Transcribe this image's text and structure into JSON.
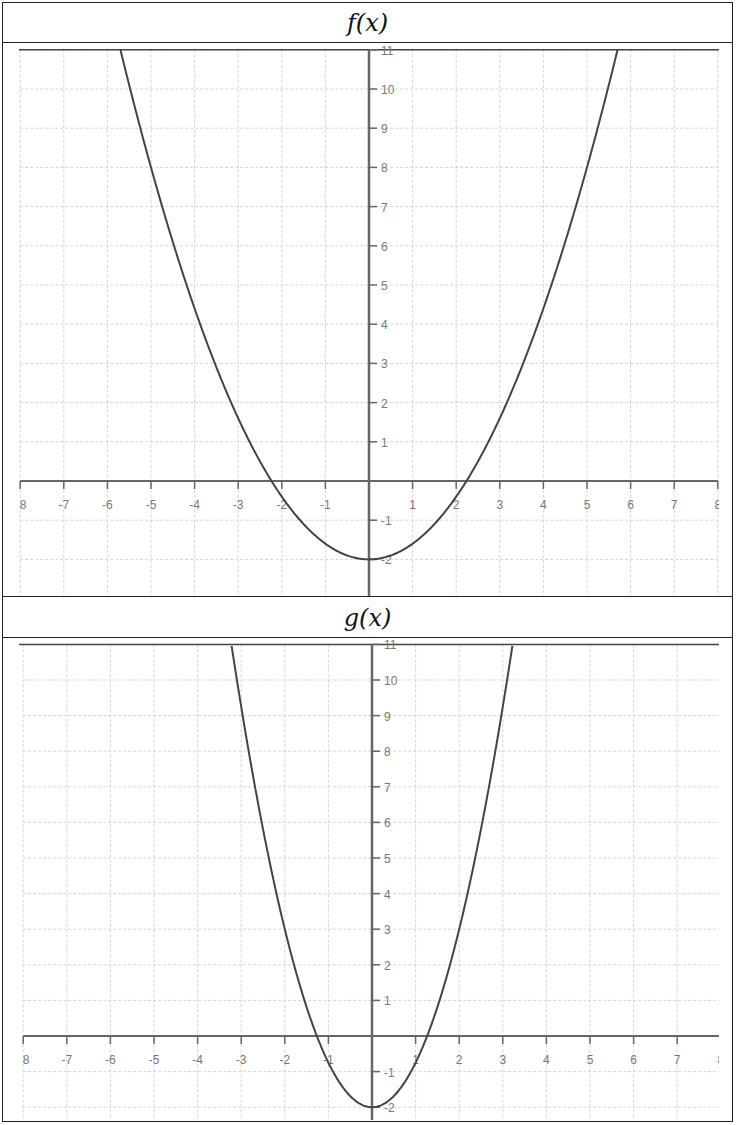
{
  "chart_data": [
    {
      "type": "line",
      "title": "f(x)",
      "function": "f(x) = 0.4x^2 - 2",
      "xlim": [
        -8,
        8
      ],
      "ylim": [
        -2.8,
        11
      ],
      "x_ticks": [
        -8,
        -7,
        -6,
        -5,
        -4,
        -3,
        -2,
        -1,
        1,
        2,
        3,
        4,
        5,
        6,
        7,
        8
      ],
      "x_tick_labels": [
        "8",
        "-7",
        "-6",
        "-5",
        "-4",
        "-3",
        "-2",
        "-1",
        "1",
        "2",
        "3",
        "4",
        "5",
        "6",
        "7",
        "8"
      ],
      "y_ticks": [
        -2,
        -1,
        1,
        2,
        3,
        4,
        5,
        6,
        7,
        8,
        9,
        10,
        11
      ],
      "y_tick_labels": [
        "-2",
        "-1",
        "1",
        "2",
        "3",
        "4",
        "5",
        "6",
        "7",
        "8",
        "9",
        "10",
        "11"
      ],
      "grid": true,
      "coef": 0.4,
      "shift": -2,
      "key_points": {
        "vertex": [
          0,
          -2
        ],
        "x_intercepts": [
          -2.24,
          2.24
        ]
      },
      "series": [
        {
          "name": "f(x)",
          "x": [
            -5.7,
            -5,
            -4,
            -3,
            -2,
            -1,
            0,
            1,
            2,
            3,
            4,
            5,
            5.7
          ],
          "y": [
            11,
            8,
            4.4,
            1.6,
            -0.4,
            -1.6,
            -2,
            -1.6,
            -0.4,
            1.6,
            4.4,
            8,
            11
          ]
        }
      ]
    },
    {
      "type": "line",
      "title": "g(x)",
      "function": "g(x) = 1.25x^2 - 2",
      "xlim": [
        -8,
        8
      ],
      "ylim": [
        -2.3,
        11
      ],
      "x_ticks": [
        -8,
        -7,
        -6,
        -5,
        -4,
        -3,
        -2,
        -1,
        1,
        2,
        3,
        4,
        5,
        6,
        7,
        8
      ],
      "x_tick_labels": [
        "8",
        "-7",
        "-6",
        "-5",
        "-4",
        "-3",
        "-2",
        "-1",
        "1",
        "2",
        "3",
        "4",
        "5",
        "6",
        "7",
        "8"
      ],
      "y_ticks": [
        -2,
        -1,
        1,
        2,
        3,
        4,
        5,
        6,
        7,
        8,
        9,
        10,
        11
      ],
      "y_tick_labels": [
        "-2",
        "-1",
        "1",
        "2",
        "3",
        "4",
        "5",
        "6",
        "7",
        "8",
        "9",
        "10",
        "11"
      ],
      "grid": true,
      "coef": 1.25,
      "shift": -2,
      "key_points": {
        "vertex": [
          0,
          -2
        ],
        "x_intercepts": [
          -1.26,
          1.26
        ]
      },
      "series": [
        {
          "name": "g(x)",
          "x": [
            -3.22,
            -3,
            -2,
            -1,
            0,
            1,
            2,
            3,
            3.22
          ],
          "y": [
            11,
            9.25,
            3,
            -0.75,
            -2,
            -0.75,
            3,
            9.25,
            11
          ]
        }
      ]
    }
  ],
  "panels": {
    "top": {
      "title": "f(x)"
    },
    "bottom": {
      "title": "g(x)"
    }
  },
  "colors": {
    "curve": "#444444",
    "axis": "#666666",
    "grid": "#d4d4d4",
    "label": "#777777",
    "border": "#222222"
  }
}
